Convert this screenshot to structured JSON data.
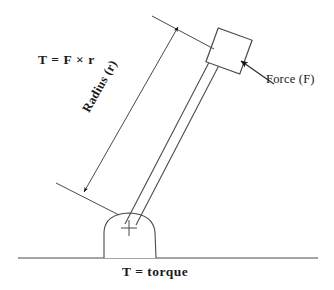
{
  "figure": {
    "title_caption": "T = torque",
    "formula": "T = F × r",
    "radius_label": "Radius (r)",
    "force_label": "Force (F)",
    "pivot_mark": "+",
    "colors": {
      "background": "#ffffff",
      "stroke": "#4a4a4a",
      "text": "#1a1a1a",
      "arrow_fill": "#111111"
    },
    "geometry": {
      "ground_line": {
        "x1": 18,
        "y1": 258,
        "x2": 318,
        "y2": 258
      },
      "fulcrum": {
        "left_x": 103,
        "right_x": 157,
        "base_y": 258,
        "apex_y": 214
      },
      "pivot_point": {
        "x": 129,
        "y": 228
      },
      "lever_shaft": {
        "from_x": 129,
        "from_y": 222,
        "to_x": 222,
        "to_y": 46,
        "width": 11
      },
      "force_box": {
        "center_x": 229,
        "center_y": 51,
        "size": 35,
        "rotation_deg": 20
      },
      "dimension_line": {
        "x1": 84,
        "y1": 192,
        "x2": 178,
        "y2": 27
      },
      "force_arrow": {
        "tip_x": 243,
        "tip_y": 63,
        "tail_x": 268,
        "tail_y": 80
      }
    }
  }
}
